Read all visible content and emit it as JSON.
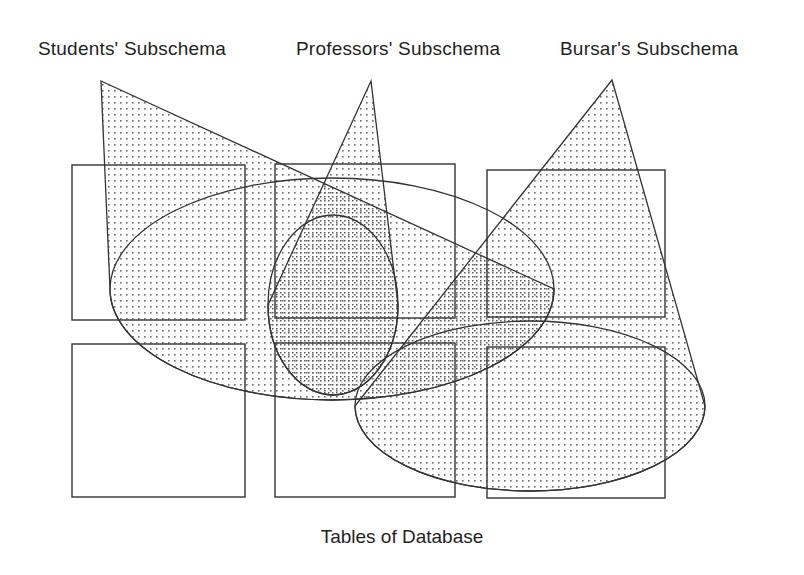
{
  "diagram": {
    "title_bottom": "Tables of Database",
    "subschema_labels": [
      {
        "id": "students",
        "text": "Students' Subschema"
      },
      {
        "id": "professors",
        "text": "Professors' Subschema"
      },
      {
        "id": "bursar",
        "text": "Bursar's Subschema"
      }
    ],
    "colors": {
      "stroke": "#333333",
      "background": "#ffffff",
      "stipple_light": "#6b6b6b",
      "stipple_dark": "#3a3a3a",
      "text": "#1f1f1f"
    },
    "tables": [
      {
        "name": "table-top-left",
        "x": 72,
        "y": 165,
        "w": 173,
        "h": 155
      },
      {
        "name": "table-top-middle",
        "x": 275,
        "y": 164,
        "w": 180,
        "h": 154
      },
      {
        "name": "table-top-right",
        "x": 487,
        "y": 170,
        "w": 178,
        "h": 147
      },
      {
        "name": "table-bottom-left",
        "x": 72,
        "y": 344,
        "w": 173,
        "h": 153
      },
      {
        "name": "table-bottom-middle",
        "x": 275,
        "y": 343,
        "w": 180,
        "h": 154
      },
      {
        "name": "table-bottom-right",
        "x": 487,
        "y": 347,
        "w": 178,
        "h": 151
      }
    ],
    "cones": [
      {
        "name": "cone-students",
        "apex_x": 101,
        "apex_y": 81,
        "ellipse_cx": 332,
        "ellipse_cy": 289,
        "ellipse_rx": 222,
        "ellipse_ry": 111
      },
      {
        "name": "cone-professors",
        "apex_x": 371,
        "apex_y": 81,
        "ellipse_cx": 333,
        "ellipse_cy": 305,
        "ellipse_rx": 65,
        "ellipse_ry": 90
      },
      {
        "name": "cone-bursar",
        "apex_x": 612,
        "apex_y": 80,
        "ellipse_cx": 530,
        "ellipse_cy": 406,
        "ellipse_rx": 175,
        "ellipse_ry": 85
      }
    ]
  }
}
